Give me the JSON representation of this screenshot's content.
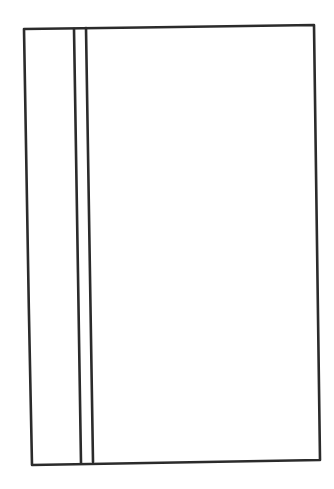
{
  "sketch": {
    "description": "hand-drawn rectangle with two vertical lines near left edge",
    "stroke_color": "#2b2b2b",
    "background_color": "#ffffff",
    "outer_rectangle": {
      "top_left": [
        24,
        29
      ],
      "top_right": [
        314,
        25
      ],
      "bottom_right": [
        320,
        460
      ],
      "bottom_left": [
        32,
        465
      ]
    },
    "vertical_lines": [
      {
        "top": [
          74,
          29
        ],
        "bottom": [
          81,
          463
        ]
      },
      {
        "top": [
          86,
          28
        ],
        "bottom": [
          93,
          462
        ]
      }
    ]
  }
}
